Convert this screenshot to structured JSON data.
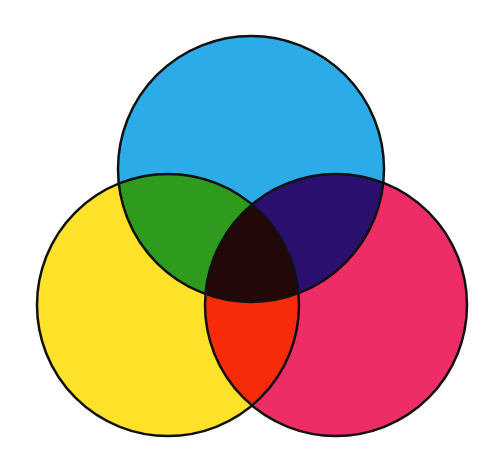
{
  "diagram": {
    "type": "venn-3-set",
    "background": "#ffffff",
    "stroke": "#111111",
    "stroke_width": 2.5,
    "circles": [
      {
        "id": "cyan",
        "label": "",
        "cx": 251,
        "cy": 169,
        "r": 133,
        "color": "#2BACE8"
      },
      {
        "id": "yellow",
        "label": "",
        "cx": 168,
        "cy": 305,
        "r": 131,
        "color": "#FEE22A"
      },
      {
        "id": "magenta",
        "label": "",
        "cx": 336,
        "cy": 305,
        "r": 131,
        "color": "#EE2D66"
      }
    ],
    "overlaps": {
      "cyan_yellow": "#2E9A1E",
      "cyan_magenta": "#2A0F6E",
      "yellow_magenta": "#F72B0A",
      "all_three": "#220808"
    }
  }
}
